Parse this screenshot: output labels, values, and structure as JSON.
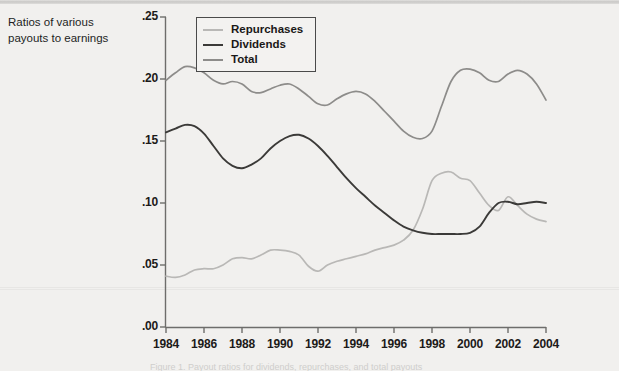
{
  "caption": {
    "line1": "Ratios of various",
    "line2": "payouts to earnings",
    "full": "Ratios of various payouts to earnings"
  },
  "legend": {
    "position": "top-left-inside",
    "items": [
      {
        "label": "Repurchases",
        "color": "#b9b8b6"
      },
      {
        "label": "Dividends",
        "color": "#3b3a38"
      },
      {
        "label": "Total",
        "color": "#8d8c8a"
      }
    ]
  },
  "axes": {
    "y_ticks": [
      ".00",
      ".05",
      ".10",
      ".15",
      ".20",
      ".25"
    ],
    "x_ticks": [
      "1984",
      "1986",
      "1988",
      "1990",
      "1992",
      "1994",
      "1996",
      "1998",
      "2000",
      "2002",
      "2004"
    ]
  },
  "chart_data": {
    "type": "line",
    "title": "",
    "subtitle": "",
    "xlabel": "",
    "ylabel": "Ratios of various payouts to earnings",
    "xlim": [
      1984,
      2004
    ],
    "ylim": [
      0.0,
      0.25
    ],
    "ytick_labels": [
      ".00",
      ".05",
      ".10",
      ".15",
      ".20",
      ".25"
    ],
    "ytick_values": [
      0.0,
      0.05,
      0.1,
      0.15,
      0.2,
      0.25
    ],
    "xtick_labels": [
      "1984",
      "1986",
      "1988",
      "1990",
      "1992",
      "1994",
      "1996",
      "1998",
      "2000",
      "2002",
      "2004"
    ],
    "xtick_values": [
      1984,
      1986,
      1988,
      1990,
      1992,
      1994,
      1996,
      1998,
      2000,
      2002,
      2004
    ],
    "grid": false,
    "legend_position": "upper left",
    "x": [
      1984,
      1984.5,
      1985,
      1985.5,
      1986,
      1986.5,
      1987,
      1987.5,
      1988,
      1988.5,
      1989,
      1989.5,
      1990,
      1990.5,
      1991,
      1991.5,
      1992,
      1992.5,
      1993,
      1993.5,
      1994,
      1994.5,
      1995,
      1995.5,
      1996,
      1996.5,
      1997,
      1997.5,
      1998,
      1998.5,
      1999,
      1999.5,
      2000,
      2000.5,
      2001,
      2001.5,
      2002,
      2002.5,
      2003,
      2003.5,
      2004
    ],
    "series": [
      {
        "name": "Repurchases",
        "color": "#b9b8b6",
        "values": [
          0.041,
          0.04,
          0.042,
          0.046,
          0.047,
          0.047,
          0.05,
          0.055,
          0.056,
          0.055,
          0.058,
          0.062,
          0.062,
          0.061,
          0.058,
          0.049,
          0.045,
          0.05,
          0.053,
          0.055,
          0.057,
          0.059,
          0.062,
          0.064,
          0.066,
          0.07,
          0.078,
          0.095,
          0.118,
          0.124,
          0.125,
          0.12,
          0.118,
          0.108,
          0.098,
          0.094,
          0.105,
          0.098,
          0.091,
          0.087,
          0.085
        ]
      },
      {
        "name": "Dividends",
        "color": "#3b3a38",
        "values": [
          0.157,
          0.16,
          0.163,
          0.162,
          0.156,
          0.146,
          0.136,
          0.13,
          0.128,
          0.131,
          0.136,
          0.144,
          0.15,
          0.154,
          0.155,
          0.152,
          0.146,
          0.138,
          0.129,
          0.12,
          0.112,
          0.105,
          0.098,
          0.092,
          0.086,
          0.081,
          0.078,
          0.076,
          0.075,
          0.075,
          0.075,
          0.075,
          0.076,
          0.081,
          0.092,
          0.1,
          0.101,
          0.099,
          0.1,
          0.101,
          0.1
        ]
      },
      {
        "name": "Total",
        "color": "#8d8c8a",
        "values": [
          0.199,
          0.205,
          0.21,
          0.209,
          0.205,
          0.199,
          0.196,
          0.198,
          0.196,
          0.19,
          0.189,
          0.192,
          0.195,
          0.196,
          0.192,
          0.186,
          0.18,
          0.179,
          0.184,
          0.188,
          0.19,
          0.188,
          0.182,
          0.174,
          0.166,
          0.158,
          0.153,
          0.152,
          0.158,
          0.178,
          0.198,
          0.207,
          0.208,
          0.205,
          0.199,
          0.198,
          0.204,
          0.207,
          0.204,
          0.196,
          0.183
        ]
      }
    ]
  },
  "footer_ghost": "Figure 1. Payout ratios for dividends, repurchases, and total payouts"
}
